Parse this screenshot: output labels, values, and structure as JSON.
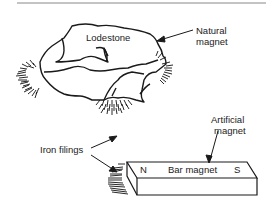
{
  "diagram": {
    "labels": {
      "lodestone": "Lodestone",
      "natural_magnet_line1": "Natural",
      "natural_magnet_line2": "magnet",
      "artificial_magnet_line1": "Artificial",
      "artificial_magnet_line2": "magnet",
      "iron_filings": "Iron filings",
      "bar_magnet": "Bar magnet",
      "north_pole": "N",
      "south_pole": "S"
    },
    "colors": {
      "ink": "#1a1a1a",
      "rule": "#888888",
      "background": "#ffffff"
    }
  }
}
